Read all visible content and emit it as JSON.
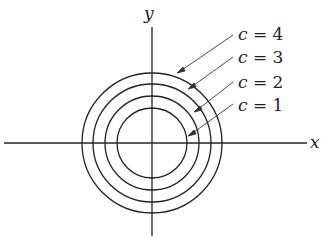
{
  "diagram": {
    "axes": {
      "x_label": "x",
      "y_label": "y"
    },
    "curves": [
      {
        "label": "c = 4",
        "c": "4",
        "r": 70
      },
      {
        "label": "c = 3",
        "c": "3",
        "r": 59
      },
      {
        "label": "c = 2",
        "c": "2",
        "r": 47
      },
      {
        "label": "c = 1",
        "c": "1",
        "r": 35
      }
    ],
    "colors": {
      "line": "#222222",
      "background": "#ffffff"
    }
  }
}
